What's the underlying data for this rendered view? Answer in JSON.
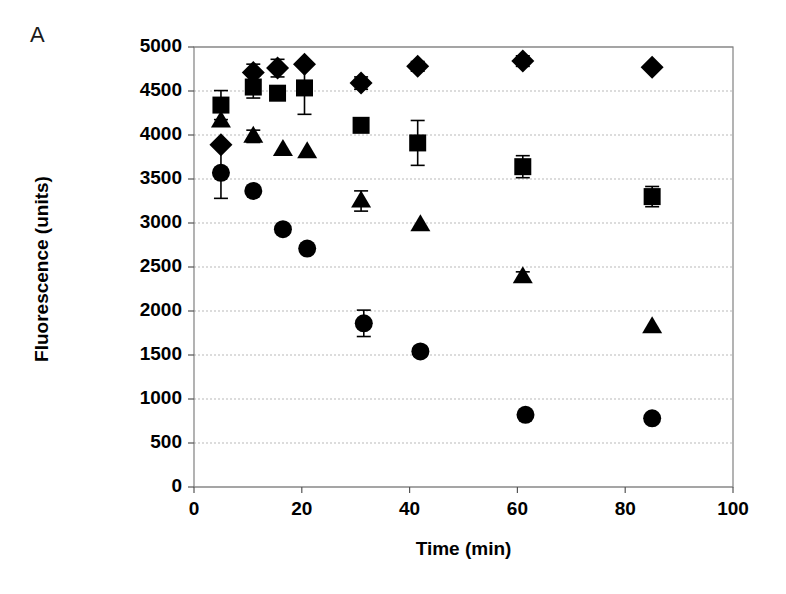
{
  "figure": {
    "panel_label": "A",
    "background_color": "#ffffff",
    "marker_color": "#000000",
    "grid_color": "#b9b9b9",
    "axis_color": "#808080"
  },
  "chart_data": {
    "type": "scatter",
    "title": "",
    "xlabel": "Time (min)",
    "ylabel": "Fluorescence (units)",
    "xlim": [
      0,
      100
    ],
    "ylim": [
      0,
      5000
    ],
    "xticks": [
      0,
      20,
      40,
      60,
      80,
      100
    ],
    "yticks": [
      0,
      500,
      1000,
      1500,
      2000,
      2500,
      3000,
      3500,
      4000,
      4500,
      5000
    ],
    "xtick_labels": [
      "0",
      "20",
      "40",
      "60",
      "80",
      "100"
    ],
    "ytick_labels": [
      "0",
      "500",
      "1000",
      "1500",
      "2000",
      "2500",
      "3000",
      "3500",
      "4000",
      "4500",
      "5000"
    ],
    "grid": "horizontal",
    "legend": "none",
    "series": [
      {
        "name": "diamond",
        "marker": "diamond",
        "color": "#000000",
        "points": [
          {
            "x": 5.0,
            "y": 3890,
            "yerr": 0
          },
          {
            "x": 11.0,
            "y": 4710,
            "yerr": 95
          },
          {
            "x": 15.5,
            "y": 4760,
            "yerr": 100
          },
          {
            "x": 20.5,
            "y": 4805,
            "yerr": 0
          },
          {
            "x": 31.0,
            "y": 4590,
            "yerr": 70
          },
          {
            "x": 41.5,
            "y": 4780,
            "yerr": 55
          },
          {
            "x": 61.0,
            "y": 4840,
            "yerr": 60
          },
          {
            "x": 85.0,
            "y": 4770,
            "yerr": 0
          }
        ]
      },
      {
        "name": "square",
        "marker": "square",
        "color": "#000000",
        "points": [
          {
            "x": 5.0,
            "y": 4340,
            "yerr": 165
          },
          {
            "x": 11.0,
            "y": 4545,
            "yerr": 125
          },
          {
            "x": 15.5,
            "y": 4475,
            "yerr": 0
          },
          {
            "x": 20.5,
            "y": 4535,
            "yerr": 300
          },
          {
            "x": 31.0,
            "y": 4110,
            "yerr": 0
          },
          {
            "x": 41.5,
            "y": 3910,
            "yerr": 255
          },
          {
            "x": 61.0,
            "y": 3640,
            "yerr": 125
          },
          {
            "x": 85.0,
            "y": 3300,
            "yerr": 115
          }
        ]
      },
      {
        "name": "triangle",
        "marker": "triangle",
        "color": "#000000",
        "points": [
          {
            "x": 5.0,
            "y": 4160,
            "yerr": 0
          },
          {
            "x": 11.0,
            "y": 3985,
            "yerr": 70
          },
          {
            "x": 16.5,
            "y": 3835,
            "yerr": 0
          },
          {
            "x": 21.0,
            "y": 3810,
            "yerr": 0
          },
          {
            "x": 31.0,
            "y": 3250,
            "yerr": 115
          },
          {
            "x": 42.0,
            "y": 2980,
            "yerr": 0
          },
          {
            "x": 61.0,
            "y": 2390,
            "yerr": 55
          },
          {
            "x": 85.0,
            "y": 1820,
            "yerr": 0
          }
        ]
      },
      {
        "name": "circle",
        "marker": "circle",
        "color": "#000000",
        "points": [
          {
            "x": 5.0,
            "y": 3570,
            "yerr": 290
          },
          {
            "x": 11.0,
            "y": 3365,
            "yerr": 0
          },
          {
            "x": 16.5,
            "y": 2930,
            "yerr": 0
          },
          {
            "x": 21.0,
            "y": 2710,
            "yerr": 0
          },
          {
            "x": 31.5,
            "y": 1860,
            "yerr": 150
          },
          {
            "x": 42.0,
            "y": 1540,
            "yerr": 55
          },
          {
            "x": 61.5,
            "y": 820,
            "yerr": 0
          },
          {
            "x": 85.0,
            "y": 780,
            "yerr": 0
          }
        ]
      }
    ]
  },
  "plot_geometry": {
    "left": 194,
    "top": 47,
    "right": 733,
    "bottom": 487
  }
}
